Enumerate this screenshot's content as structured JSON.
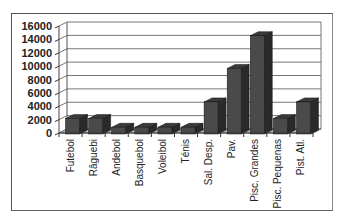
{
  "chart_data": {
    "type": "bar",
    "title": "",
    "xlabel": "",
    "ylabel": "",
    "style": "3d-column",
    "grid": true,
    "legend": "none",
    "ylim": [
      0,
      16000
    ],
    "yticks": [
      0,
      2000,
      4000,
      6000,
      8000,
      10000,
      12000,
      14000,
      16000
    ],
    "yticks_labels": [
      "0",
      "2000",
      "4000",
      "6000",
      "8000",
      "10000",
      "12000",
      "14000",
      "16000"
    ],
    "categories": [
      "Futebol",
      "Râguebi",
      "Andebol",
      "Basquebol",
      "Voleibol",
      "Ténis",
      "Sal. Desp.",
      "Pav.",
      "Pisc. Grandes",
      "Pisc. Pequenas",
      "Pist. Atl."
    ],
    "values": [
      2300,
      2300,
      1000,
      1000,
      1000,
      1000,
      4800,
      9800,
      14700,
      2300,
      4800
    ],
    "colors": {
      "bar_front": "#4a4a4a",
      "bar_side": "#2a2a2a",
      "bar_top": "#3a3a3a",
      "grid": "#777777",
      "frame": "#555555"
    }
  }
}
